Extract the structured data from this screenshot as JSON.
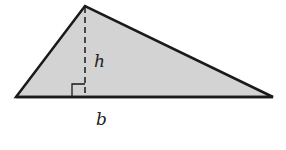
{
  "diagram": {
    "type": "triangle-area",
    "fill_color": "#d3d3d3",
    "stroke_color": "#1a1a1a",
    "vertices": {
      "apex": [
        85,
        6
      ],
      "left": [
        16,
        97
      ],
      "right": [
        273,
        97
      ]
    },
    "height_line": {
      "style": "dashed",
      "from": [
        85,
        6
      ],
      "to": [
        85,
        97
      ]
    },
    "right_angle_marker": {
      "x": 72,
      "y": 84,
      "size": 13
    },
    "labels": {
      "height": "h",
      "base": "b"
    }
  }
}
